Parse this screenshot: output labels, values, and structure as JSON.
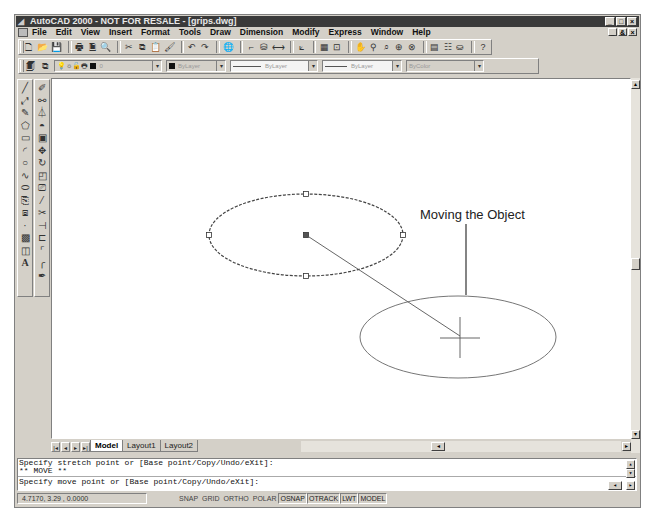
{
  "window": {
    "title": "AutoCAD 2000 - NOT FOR RESALE - [grips.dwg]",
    "controls": [
      "_",
      "□",
      "×"
    ],
    "mdi_controls": [
      "_",
      "&",
      "×"
    ]
  },
  "menubar": {
    "items": [
      {
        "label": "File"
      },
      {
        "label": "Edit"
      },
      {
        "label": "View"
      },
      {
        "label": "Insert"
      },
      {
        "label": "Format"
      },
      {
        "label": "Tools"
      },
      {
        "label": "Draw"
      },
      {
        "label": "Dimension"
      },
      {
        "label": "Modify"
      },
      {
        "label": "Express"
      },
      {
        "label": "Window"
      },
      {
        "label": "Help"
      }
    ]
  },
  "standard_toolbar": {
    "icons": [
      "new-icon",
      "open-icon",
      "save-icon",
      "print-icon",
      "print-preview-icon",
      "find-icon",
      "cut-icon",
      "copy-icon",
      "paste-icon",
      "match-properties-icon",
      "undo-icon",
      "redo-icon",
      "hyperlink-icon",
      "snap-from-icon",
      "point-filters-icon",
      "distance-icon",
      "ucs-icon",
      "aerial-view-icon",
      "named-views-icon",
      "pan-icon",
      "zoom-realtime-icon",
      "zoom-window-icon",
      "zoom-previous-icon",
      "properties-icon",
      "design-center-icon",
      "dbconnect-icon",
      "help-icon"
    ]
  },
  "properties_toolbar": {
    "layer_value": "0",
    "color_value": "ByLayer",
    "linetype_value": "ByLayer",
    "lineweight_value": "ByLayer",
    "plotstyle_value": "ByColor"
  },
  "draw_toolbar": {
    "icons": [
      "line-icon",
      "construction-line-icon",
      "polyline-icon",
      "polygon-icon",
      "rectangle-icon",
      "arc-icon",
      "circle-icon",
      "spline-icon",
      "ellipse-icon",
      "insert-block-icon",
      "make-block-icon",
      "point-icon",
      "hatch-icon",
      "region-icon",
      "text-icon"
    ]
  },
  "modify_toolbar": {
    "icons": [
      "erase-icon",
      "copy-object-icon",
      "mirror-icon",
      "offset-icon",
      "array-icon",
      "move-icon",
      "rotate-icon",
      "scale-icon",
      "stretch-icon",
      "lengthen-icon",
      "trim-icon",
      "extend-icon",
      "break-icon",
      "chamfer-icon",
      "fillet-icon",
      "explode-icon"
    ]
  },
  "drawing": {
    "annotation": "Moving the Object",
    "original_ellipse": {
      "cx": 254,
      "cy": 156,
      "rx": 97,
      "ry": 41,
      "style": "dashed-selected"
    },
    "moved_ellipse": {
      "cx": 408,
      "cy": 257,
      "rx": 98,
      "ry": 41
    },
    "rubberband": {
      "x1": 254,
      "y1": 156,
      "x2": 408,
      "y2": 257
    },
    "leader": {
      "x": 414,
      "y1": 145,
      "y2": 216
    }
  },
  "layout_tabs": {
    "nav": [
      "|◂",
      "◂",
      "▸",
      "▸|"
    ],
    "tabs": [
      {
        "label": "Model",
        "active": true
      },
      {
        "label": "Layout1",
        "active": false
      },
      {
        "label": "Layout2",
        "active": false
      }
    ]
  },
  "command": {
    "lines": [
      "Specify stretch point or [Base point/Copy/Undo/eXit]:",
      "** MOVE **",
      "Specify move point or [Base point/Copy/Undo/eXit]:"
    ]
  },
  "statusbar": {
    "coords": "4.7170, 3.29  , 0.0000",
    "toggles": [
      {
        "label": "SNAP",
        "on": false
      },
      {
        "label": "GRID",
        "on": false
      },
      {
        "label": "ORTHO",
        "on": false
      },
      {
        "label": "POLAR",
        "on": false
      },
      {
        "label": "OSNAP",
        "on": true
      },
      {
        "label": "OTRACK",
        "on": true
      },
      {
        "label": "LWT",
        "on": true
      },
      {
        "label": "MODEL",
        "on": true
      }
    ]
  },
  "colors": {
    "titlebar": "#3a3a3a",
    "chrome": "#d4d0c8",
    "canvas": "#ffffff",
    "entity": "#555555"
  }
}
